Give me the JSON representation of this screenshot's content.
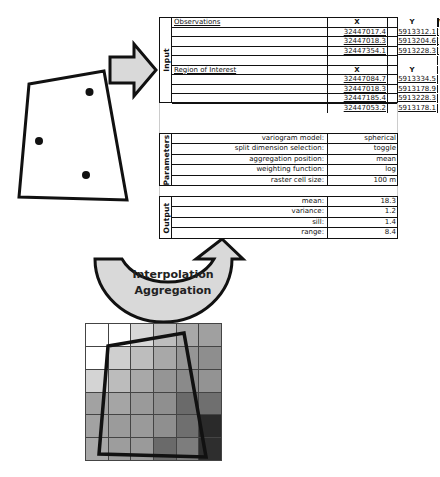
{
  "input": {
    "section_label": "Input",
    "observations": {
      "title": "Observations",
      "headers": [
        "X",
        "Y",
        "Val"
      ],
      "rows": [
        [
          "32447017.4",
          "5913312.1",
          "17.4"
        ],
        [
          "32447018.3",
          "5913204.6",
          "19.2"
        ],
        [
          "32447354.1",
          "5913228.3",
          "16.8"
        ]
      ]
    },
    "region_of_interest": {
      "title": "Region of Interest",
      "headers": [
        "X",
        "Y"
      ],
      "rows": [
        [
          "32447084.7",
          "5913334.5"
        ],
        [
          "32447018.3",
          "5913178.9"
        ],
        [
          "32447185.4",
          "5913228.3"
        ],
        [
          "32447053.2",
          "5913178.1"
        ]
      ]
    }
  },
  "parameters": {
    "section_label": "Parameters",
    "rows": [
      {
        "label": "variogram model:",
        "value": "spherical"
      },
      {
        "label": "split dimension selection:",
        "value": "toggle"
      },
      {
        "label": "aggregation position:",
        "value": "mean"
      },
      {
        "label": "weighting function:",
        "value": "log"
      },
      {
        "label": "raster cell size:",
        "value": "100 m"
      }
    ]
  },
  "output": {
    "section_label": "Output",
    "rows": [
      {
        "label": "mean:",
        "value": "18.3"
      },
      {
        "label": "variance:",
        "value": "1.2"
      },
      {
        "label": "sill:",
        "value": "1.4"
      },
      {
        "label": "range:",
        "value": "8.4"
      }
    ]
  },
  "process_arrow": {
    "line1": "Interpolation",
    "line2": "Aggregation"
  },
  "raster": {
    "rows": 6,
    "cols": 6,
    "cell_colors": [
      [
        "#ffffff",
        "#ffffff",
        "#d8d8d8",
        "#bdbdbd",
        "#a8a8a8",
        "#a0a0a0"
      ],
      [
        "#ffffff",
        "#cfcfcf",
        "#bdbdbd",
        "#a8a8a8",
        "#959595",
        "#8e8e8e"
      ],
      [
        "#d4d4d4",
        "#bcbcbc",
        "#a8a8a8",
        "#959595",
        "#8a8a8a",
        "#939393"
      ],
      [
        "#a2a2a2",
        "#a5a5a5",
        "#9a9a9a",
        "#8f8f8f",
        "#6a6a6a",
        "#6f6f6f"
      ],
      [
        "#a2a2a2",
        "#9b9b9b",
        "#9a9a9a",
        "#8f8f8f",
        "#6f6f6f",
        "#2a2a2a"
      ],
      [
        "#a8a8a8",
        "#9d9d9d",
        "#9a9a9a",
        "#6a6a6a",
        "#7d7d7d",
        "#2e2e2e"
      ]
    ]
  },
  "colors": {
    "arrow_fill": "#d9d9d9",
    "stroke": "#111111"
  }
}
